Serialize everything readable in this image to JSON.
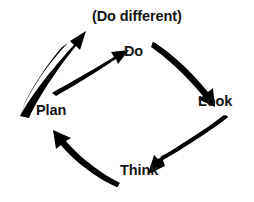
{
  "diagram": {
    "type": "cyclic-process-diagram",
    "background_color": "#ffffff",
    "ink_color": "#000000",
    "text_color": "#141414",
    "nodes": [
      {
        "id": "plan",
        "label": "Plan",
        "x": 36,
        "y": 103
      },
      {
        "id": "do",
        "label": "Do",
        "x": 124,
        "y": 44
      },
      {
        "id": "do_different",
        "label": "(Do different)",
        "x": 92,
        "y": 9
      },
      {
        "id": "look",
        "label": "Look",
        "x": 198,
        "y": 94
      },
      {
        "id": "think",
        "label": "Think",
        "x": 120,
        "y": 163
      }
    ],
    "arrows": [
      {
        "id": "plan-to-do-different",
        "from": "Plan",
        "to": "(Do different)",
        "direction": "up-right",
        "style": "long-outer-curved"
      },
      {
        "id": "plan-to-do",
        "from": "Plan",
        "to": "Do",
        "direction": "up-right",
        "style": "short-inner-curved"
      },
      {
        "id": "do-to-look",
        "from": "Do",
        "to": "Look",
        "direction": "down-right",
        "style": "curved"
      },
      {
        "id": "look-to-think",
        "from": "Look",
        "to": "Think",
        "direction": "down-left",
        "style": "curved"
      },
      {
        "id": "think-to-plan",
        "from": "Think",
        "to": "Plan",
        "direction": "up-left",
        "style": "curved"
      }
    ]
  }
}
